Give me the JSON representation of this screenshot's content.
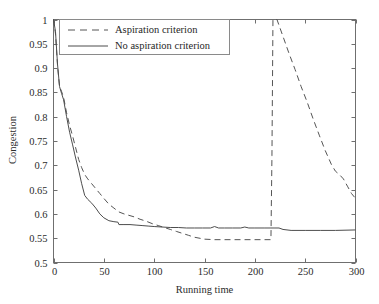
{
  "chart_data": {
    "type": "line",
    "title": "",
    "xlabel": "Running time",
    "ylabel": "Congestion",
    "xlim": [
      0,
      300
    ],
    "ylim": [
      0.5,
      1
    ],
    "grid": false,
    "legend_position": "top-left",
    "xticks": [
      0,
      50,
      100,
      150,
      200,
      250,
      300
    ],
    "xtick_labels": [
      "0",
      "50",
      "100",
      "150",
      "200",
      "250",
      "300"
    ],
    "yticks": [
      0.5,
      0.55,
      0.6,
      0.65,
      0.7,
      0.75,
      0.8,
      0.85,
      0.9,
      0.95,
      1
    ],
    "ytick_labels": [
      "0.5",
      "0.55",
      "0.6",
      "0.65",
      "0.7",
      "0.75",
      "0.8",
      "0.85",
      "0.9",
      "0.95",
      "1"
    ],
    "series": [
      {
        "name": "Aspiration criterion",
        "style": "dashed",
        "color": "#555555",
        "x": [
          0,
          2,
          4,
          6,
          8,
          10,
          13,
          16,
          19,
          22,
          25,
          28,
          31,
          34,
          38,
          42,
          46,
          50,
          55,
          60,
          65,
          70,
          75,
          80,
          86,
          92,
          98,
          104,
          110,
          116,
          122,
          128,
          134,
          140,
          150,
          160,
          170,
          180,
          190,
          200,
          210,
          216,
          217,
          218,
          222,
          228,
          234,
          240,
          246,
          252,
          258,
          264,
          270,
          276,
          280,
          284,
          288,
          292,
          296,
          300
        ],
        "y": [
          1.0,
          0.97,
          0.905,
          0.862,
          0.852,
          0.84,
          0.808,
          0.782,
          0.76,
          0.736,
          0.712,
          0.695,
          0.681,
          0.672,
          0.662,
          0.652,
          0.642,
          0.632,
          0.62,
          0.612,
          0.604,
          0.6,
          0.597,
          0.594,
          0.589,
          0.585,
          0.58,
          0.576,
          0.572,
          0.568,
          0.564,
          0.56,
          0.556,
          0.552,
          0.548,
          0.547,
          0.547,
          0.547,
          0.547,
          0.547,
          0.547,
          0.547,
          0.72,
          1.0,
          1.0,
          0.965,
          0.93,
          0.897,
          0.862,
          0.83,
          0.795,
          0.762,
          0.73,
          0.702,
          0.688,
          0.681,
          0.672,
          0.657,
          0.642,
          0.632
        ]
      },
      {
        "name": "No aspiration criterion",
        "style": "solid",
        "color": "#4d4d4d",
        "x": [
          0,
          2,
          4,
          6,
          8,
          10,
          13,
          16,
          19,
          22,
          25,
          28,
          31,
          34,
          38,
          42,
          46,
          50,
          55,
          60,
          64,
          65,
          70,
          76,
          82,
          88,
          94,
          100,
          108,
          116,
          124,
          132,
          140,
          148,
          156,
          160,
          164,
          170,
          178,
          186,
          190,
          194,
          200,
          210,
          216,
          220,
          224,
          228,
          236,
          250,
          265,
          280,
          300
        ],
        "y": [
          1.0,
          0.975,
          0.908,
          0.862,
          0.848,
          0.835,
          0.8,
          0.768,
          0.742,
          0.715,
          0.69,
          0.662,
          0.638,
          0.63,
          0.622,
          0.612,
          0.6,
          0.592,
          0.586,
          0.584,
          0.583,
          0.578,
          0.578,
          0.578,
          0.577,
          0.576,
          0.575,
          0.574,
          0.573,
          0.572,
          0.572,
          0.571,
          0.571,
          0.571,
          0.571,
          0.574,
          0.571,
          0.571,
          0.571,
          0.571,
          0.573,
          0.571,
          0.571,
          0.571,
          0.571,
          0.571,
          0.571,
          0.568,
          0.566,
          0.566,
          0.566,
          0.566,
          0.567
        ]
      }
    ],
    "annotations": [
      "Dashed series jumps vertically from 0.547 to 1 at running time ~217",
      "Both series start at congestion 1 at running time 0"
    ]
  },
  "legend": {
    "entries": [
      {
        "label": "Aspiration criterion",
        "style": "dashed"
      },
      {
        "label": "No aspiration criterion",
        "style": "solid"
      }
    ]
  }
}
